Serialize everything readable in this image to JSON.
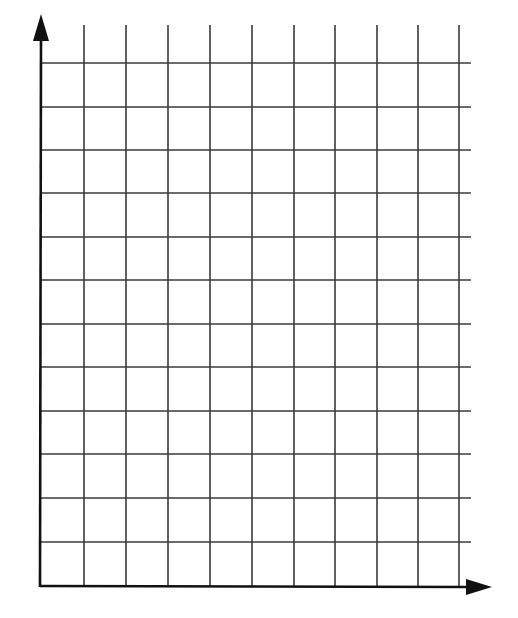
{
  "diagram": {
    "type": "blank-graph-grid",
    "title": "",
    "x_axis": {
      "label": "",
      "arrow": true,
      "x_start": 40,
      "x_end": 492,
      "y": 586
    },
    "y_axis": {
      "label": "",
      "arrow": true,
      "x": 41,
      "y_top": 14,
      "y_bottom": 586
    },
    "grid": {
      "vertical_lines_x": [
        84,
        126,
        168,
        210,
        252,
        294,
        335,
        377,
        418,
        459
      ],
      "vertical_top": 25,
      "horizontal_lines_y": [
        63,
        107,
        150,
        193,
        237,
        280,
        324,
        367,
        411,
        454,
        498,
        542
      ],
      "horizontal_right": 471,
      "columns": 10,
      "rows": 13
    },
    "colors": {
      "background": "#ffffff",
      "grid_line": "#3a3a3a",
      "axis": "#111111"
    }
  }
}
